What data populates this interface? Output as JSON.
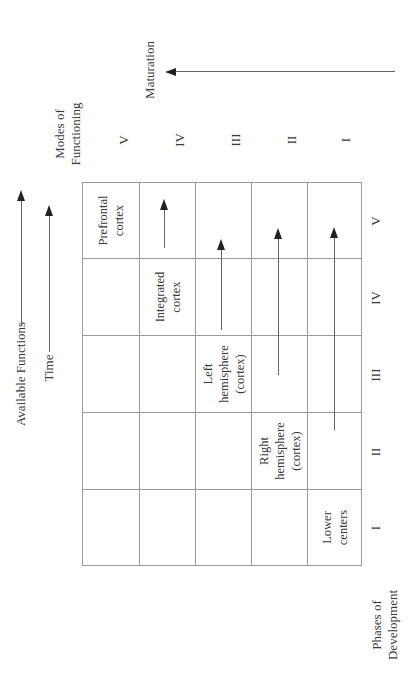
{
  "figure": {
    "top_axis": {
      "available_functions_label": "Available Functions",
      "time_label": "Time"
    },
    "column_header": {
      "title_line1": "Modes of",
      "title_line2": "Functioning",
      "numerals": [
        "V",
        "IV",
        "III",
        "II",
        "I"
      ]
    },
    "maturation_label": "Maturation",
    "row_footer": {
      "title_line1": "Phases of",
      "title_line2": "Development",
      "numerals": [
        "I",
        "II",
        "III",
        "IV",
        "V"
      ]
    },
    "cells": {
      "lower_centers": [
        "Lower",
        "centers"
      ],
      "right_hemisphere": [
        "Right",
        "hemisphere",
        "(cortex)"
      ],
      "left_hemisphere": [
        "Left",
        "hemisphere",
        "(cortex)"
      ],
      "integrated_cortex": [
        "Integrated",
        "cortex"
      ],
      "prefrontal_cortex": [
        "Prefrontal",
        "cortex"
      ]
    }
  }
}
